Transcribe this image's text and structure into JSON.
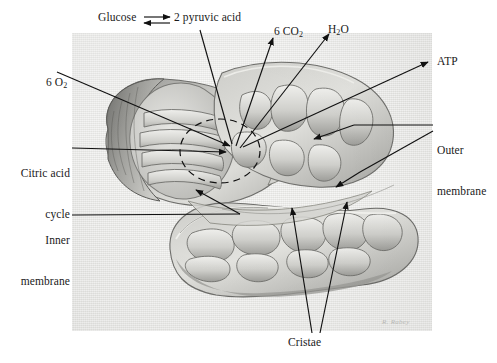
{
  "figure": {
    "panel_background": "#e9e9e7",
    "ink_color": "#111111",
    "artist_signature": "R. Rabey"
  },
  "reaction": {
    "reactant_label": "Glucose",
    "arrow_symbol": "equilibrium-double-arrow",
    "product_label": "2 pyruvic acid"
  },
  "labels": {
    "co2": {
      "text": "6 CO",
      "sub": "2",
      "full": "6 CO2"
    },
    "h2o": {
      "text": "H",
      "sub": "2",
      "tail": "O",
      "full": "H2O"
    },
    "o2": {
      "text": "6 O",
      "sub": "2",
      "full": "6 O2"
    },
    "atp": {
      "text": "ATP"
    },
    "citric_acid_cycle": {
      "line1": "Citric acid",
      "line2": "cycle"
    },
    "inner_membrane": {
      "line1": "Inner",
      "line2": "membrane"
    },
    "outer_membrane": {
      "line1": "Outer",
      "line2": "membrane"
    },
    "cristae": {
      "text": "Cristae"
    }
  },
  "icons": {
    "leader_line": "leader-line",
    "arrowhead": "arrowhead-icon",
    "dashed_circle": "dashed-circle-icon"
  }
}
